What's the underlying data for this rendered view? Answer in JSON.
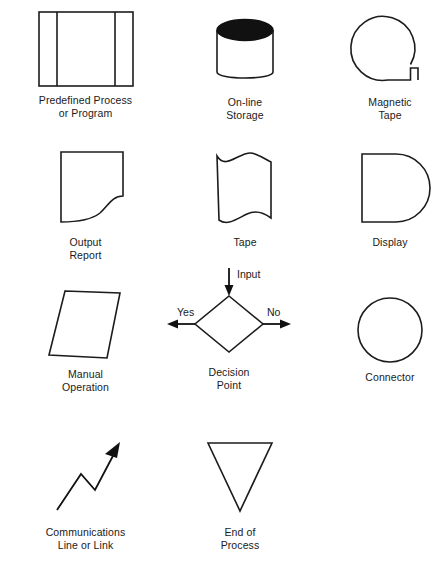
{
  "diagram": {
    "background_color": "#ffffff",
    "stroke_color": "#1c1c1c",
    "text_color": "#1a1a1a",
    "columns": 3,
    "rows": 4
  },
  "symbols": [
    {
      "id": "predefined-process",
      "shape": "rectangle-with-two-vertical-bars",
      "label_line1": "Predefined Process",
      "label_line2": "or Program"
    },
    {
      "id": "online-storage",
      "shape": "cylinder-with-filled-top",
      "label_line1": "On-line",
      "label_line2": "Storage"
    },
    {
      "id": "magnetic-tape",
      "shape": "circle-with-bottom-right-tail",
      "label_line1": "Magnetic",
      "label_line2": "Tape"
    },
    {
      "id": "output-report",
      "shape": "document-wavy-bottom",
      "label_line1": "Output",
      "label_line2": "Report"
    },
    {
      "id": "tape",
      "shape": "wavy-flag",
      "label_line1": "Tape",
      "label_line2": ""
    },
    {
      "id": "display",
      "shape": "d-shape-rounded-right",
      "label_line1": "Display",
      "label_line2": ""
    },
    {
      "id": "manual-operation",
      "shape": "parallelogram",
      "label_line1": "Manual",
      "label_line2": "Operation"
    },
    {
      "id": "decision-point",
      "shape": "diamond-with-arrows",
      "label_line1": "Decision",
      "label_line2": "Point",
      "annotations": {
        "input": "Input",
        "yes": "Yes",
        "no": "No"
      }
    },
    {
      "id": "connector",
      "shape": "circle",
      "label_line1": "Connector",
      "label_line2": ""
    },
    {
      "id": "communications-line",
      "shape": "zigzag-arrow",
      "label_line1": "Communications",
      "label_line2": "Line or Link"
    },
    {
      "id": "end-of-process",
      "shape": "inverted-triangle",
      "label_line1": "End of",
      "label_line2": "Process"
    }
  ]
}
